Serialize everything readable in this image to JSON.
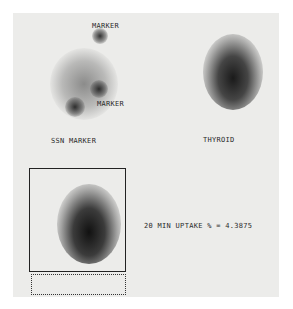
{
  "image": {
    "panels": {
      "marker_panel": {
        "labels": [
          "MARKER",
          "MARKER",
          "SSN MARKER"
        ]
      },
      "thyroid_panel": {
        "label": "THYROID"
      },
      "uptake_panel": {
        "result_text": "20 MIN UPTAKE % = 4.3875"
      }
    }
  }
}
